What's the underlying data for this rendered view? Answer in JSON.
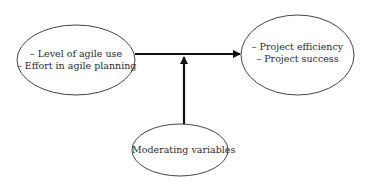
{
  "diagram": {
    "nodes": [
      {
        "id": "independent",
        "lines": [
          "– Level of agile use",
          "– Effort in agile planning"
        ]
      },
      {
        "id": "dependent",
        "lines": [
          "– Project efficiency",
          "– Project success"
        ]
      },
      {
        "id": "moderator",
        "lines": [
          "Moderating variables"
        ]
      }
    ],
    "edges": [
      {
        "from": "independent",
        "to": "dependent",
        "type": "arrow"
      },
      {
        "from": "moderator",
        "to": "independent-dependent-edge",
        "type": "arrow"
      }
    ],
    "colors": {
      "stroke": "#444444",
      "arrow": "#111111",
      "text": "#2a2a2a"
    }
  }
}
